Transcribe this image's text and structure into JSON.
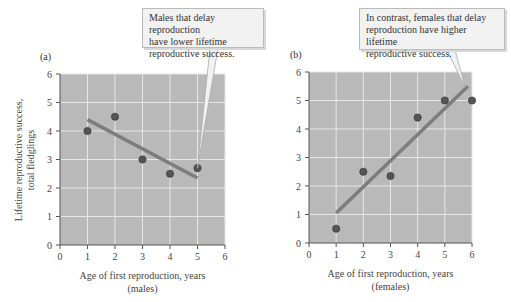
{
  "chart_data": [
    {
      "type": "scatter",
      "panel_label": "(a)",
      "title": "",
      "xlabel": "Age of first reproduction, years",
      "xlabel_sub": "(males)",
      "ylabel": "Lifetime reproductive success,",
      "ylabel_sub": "total fledglings",
      "xlim": [
        0,
        6
      ],
      "ylim": [
        0,
        6
      ],
      "xticks": [
        "0",
        "1",
        "2",
        "3",
        "4",
        "5",
        "6"
      ],
      "yticks": [
        "0",
        "1",
        "2",
        "3",
        "4",
        "5",
        "6"
      ],
      "grid": true,
      "points": [
        {
          "x": 1,
          "y": 4.0
        },
        {
          "x": 2,
          "y": 4.5
        },
        {
          "x": 3,
          "y": 3.0
        },
        {
          "x": 4,
          "y": 2.5
        },
        {
          "x": 5,
          "y": 2.7
        }
      ],
      "trend_line": {
        "x1": 1,
        "y1": 4.4,
        "x2": 5,
        "y2": 2.35
      },
      "annotation": "Males that delay reproduction have lower lifetime reproductive success."
    },
    {
      "type": "scatter",
      "panel_label": "(b)",
      "title": "",
      "xlabel": "Age of first reproduction, years",
      "xlabel_sub": "(females)",
      "ylabel": "",
      "xlim": [
        0,
        6
      ],
      "ylim": [
        0,
        6
      ],
      "xticks": [
        "0",
        "1",
        "2",
        "3",
        "4",
        "5",
        "6"
      ],
      "yticks": [
        "0",
        "1",
        "2",
        "3",
        "4",
        "5",
        "6"
      ],
      "grid": true,
      "points": [
        {
          "x": 1,
          "y": 0.5
        },
        {
          "x": 2,
          "y": 2.5
        },
        {
          "x": 3,
          "y": 2.35
        },
        {
          "x": 4,
          "y": 4.4
        },
        {
          "x": 5,
          "y": 5.0
        },
        {
          "x": 6,
          "y": 5.0
        }
      ],
      "trend_line": {
        "x1": 1,
        "y1": 1.05,
        "x2": 5.85,
        "y2": 5.5
      },
      "annotation": "In contrast, females that delay reproduction have higher lifetime reproductive success."
    }
  ],
  "callouts": {
    "a_lines": [
      "Males that delay reproduction",
      "have lower lifetime",
      "reproductive success."
    ],
    "b_lines": [
      "In contrast, females that delay",
      "reproduction have higher lifetime",
      "reproductive success."
    ]
  },
  "colors": {
    "plot_bg": "#b9b9b9",
    "grid": "#e6e6e6",
    "point": "#555555",
    "line": "#7d7d7d",
    "callout_bg": "#f2f2f2"
  }
}
